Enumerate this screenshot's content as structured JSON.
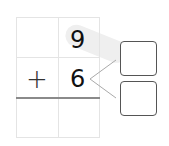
{
  "problem": {
    "top_digit": "9",
    "operator": "+",
    "bottom_digit": "6",
    "answer_boxes": [
      "",
      ""
    ]
  },
  "colors": {
    "grid": "#e4e4e4",
    "sum_line": "#8a8a8a",
    "box_border": "#555555",
    "highlight": "#efefef"
  }
}
